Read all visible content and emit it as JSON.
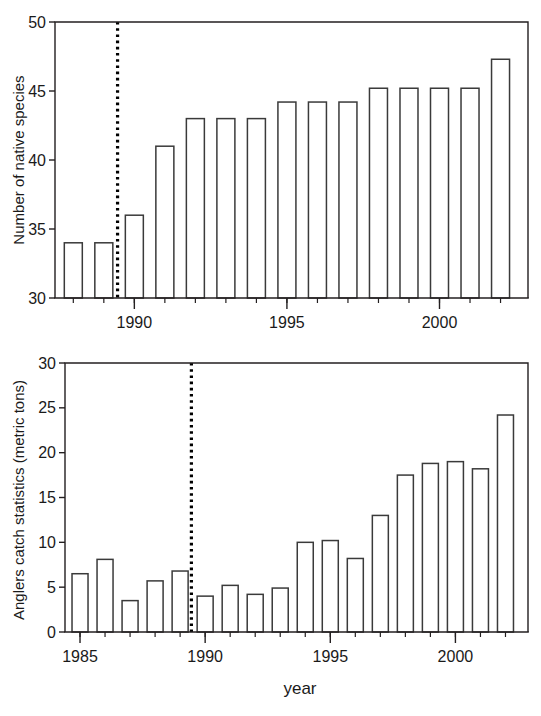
{
  "figure": {
    "background_color": "#ffffff",
    "line_color": "#231f20",
    "bar_fill_color": "#ffffff",
    "bar_stroke_color": "#3a3a3a",
    "marker_color": "#000000",
    "xlabel": "year"
  },
  "chart_data": [
    {
      "type": "bar",
      "id": "native-species",
      "title": "",
      "xlabel": "",
      "ylabel": "Number of native species",
      "categories": [
        1988,
        1989,
        1990,
        1991,
        1992,
        1993,
        1994,
        1995,
        1996,
        1997,
        1998,
        1999,
        2000,
        2001,
        2002
      ],
      "values": [
        34.0,
        34.0,
        36.0,
        41.0,
        43.0,
        43.0,
        43.0,
        44.2,
        44.2,
        44.2,
        45.2,
        45.2,
        45.2,
        45.2,
        47.3
      ],
      "xlim": [
        1987.4,
        2002.9
      ],
      "ylim": [
        30,
        50
      ],
      "yticks": [
        30,
        35,
        40,
        45,
        50
      ],
      "ytick_labels": [
        "30",
        "35",
        "40",
        "45",
        "50"
      ],
      "xticks": [
        1990,
        1995,
        2000
      ],
      "xtick_labels": [
        "1990",
        "1995",
        "2000"
      ],
      "xminor_step": 1,
      "grid": false,
      "legend": null,
      "annotations": [
        {
          "type": "vertical-dotted-line",
          "x": 1989.45,
          "label": ""
        }
      ]
    },
    {
      "type": "bar",
      "id": "anglers-catch",
      "title": "",
      "xlabel": "year",
      "ylabel": "Anglers catch statistics (metric tons)",
      "categories": [
        1985,
        1986,
        1987,
        1988,
        1989,
        1990,
        1991,
        1992,
        1993,
        1994,
        1995,
        1996,
        1997,
        1998,
        1999,
        2000,
        2001,
        2002
      ],
      "values": [
        6.5,
        8.1,
        3.5,
        5.7,
        6.8,
        4.0,
        5.2,
        4.2,
        4.9,
        10.0,
        10.2,
        8.2,
        13.0,
        17.5,
        18.8,
        19.0,
        18.2,
        24.2
      ],
      "xlim": [
        1984.4,
        2002.9
      ],
      "ylim": [
        0,
        30
      ],
      "yticks": [
        0,
        5,
        10,
        15,
        20,
        25,
        30
      ],
      "ytick_labels": [
        "0",
        "5",
        "10",
        "15",
        "20",
        "25",
        "30"
      ],
      "xticks": [
        1985,
        1990,
        1995,
        2000
      ],
      "xtick_labels": [
        "1985",
        "1990",
        "1995",
        "2000"
      ],
      "xminor_step": 1,
      "grid": false,
      "legend": null,
      "annotations": [
        {
          "type": "vertical-dotted-line",
          "x": 1989.45,
          "label": ""
        }
      ]
    }
  ]
}
